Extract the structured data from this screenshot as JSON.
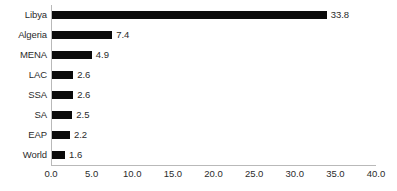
{
  "chart_data": {
    "type": "bar",
    "orientation": "horizontal",
    "title": "",
    "subtitle": "",
    "xlabel": "",
    "ylabel": "",
    "categories": [
      "Libya",
      "Algeria",
      "MENA",
      "LAC",
      "SSA",
      "SA",
      "EAP",
      "World"
    ],
    "values": [
      33.8,
      7.4,
      4.9,
      2.6,
      2.6,
      2.5,
      2.2,
      1.6
    ],
    "value_labels": [
      "33.8",
      "7.4",
      "4.9",
      "2.6",
      "2.6",
      "2.5",
      "2.2",
      "1.6"
    ],
    "xlim": [
      0,
      40
    ],
    "xticks": [
      0,
      5,
      10,
      15,
      20,
      25,
      30,
      35,
      40
    ],
    "xtick_labels": [
      "0.0",
      "5.0",
      "10.0",
      "15.0",
      "20.0",
      "25.0",
      "30.0",
      "35.0",
      "40.0"
    ],
    "grid": false,
    "legend": false,
    "legend_position": "none",
    "bar_color": "#0a0a0a",
    "axis_color": "#b9b9b9",
    "text_color": "#2b2b2b",
    "background_color": "#ffffff"
  }
}
